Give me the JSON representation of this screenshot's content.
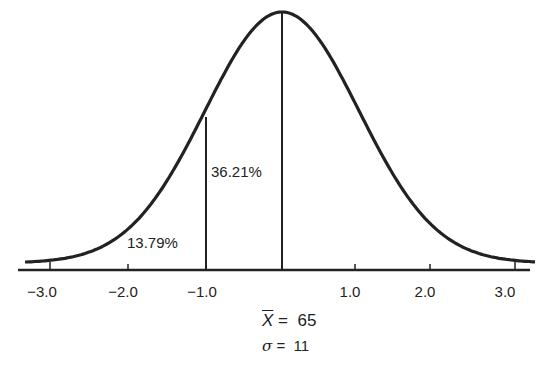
{
  "chart_data": {
    "type": "area",
    "xlabel": "",
    "ylabel": "",
    "x_ticks": [
      "-3.0",
      "-2.0",
      "-1.0",
      "1.0",
      "2.0",
      "3.0"
    ],
    "x_tick_values": [
      -3,
      -2,
      -1,
      1,
      2,
      3
    ],
    "xlim": [
      -3.3,
      3.3
    ],
    "annotations": [
      {
        "text": "13.79%",
        "region": "below -1.0 (left tail)"
      },
      {
        "text": "36.21%",
        "region": "between -1.0 and mean"
      }
    ],
    "vertical_lines": [
      -1.0,
      0.0
    ],
    "mean_label": "X̄ = 65",
    "sd_label": "σ = 11",
    "grid": false,
    "legend": null
  },
  "labels": {
    "pct_left": "13.79%",
    "pct_mid": "36.21%",
    "mean": "X̄ = 65",
    "mean_symbol": "X",
    "mean_value": "=  65",
    "sigma_symbol": "σ",
    "sigma_value": "=  11",
    "ticks": [
      "−3.0",
      "−2.0",
      "−1.0",
      "1.0",
      "2.0",
      "3.0"
    ]
  },
  "colors": {
    "ink": "#222222",
    "background": "#ffffff"
  }
}
